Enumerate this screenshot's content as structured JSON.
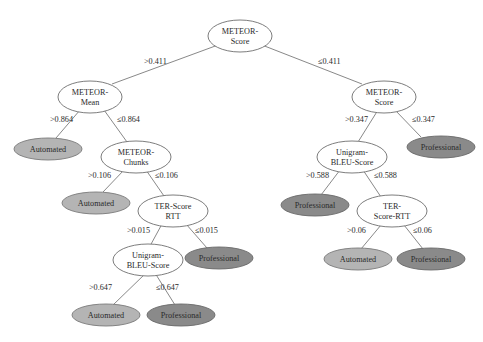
{
  "diagram": {
    "type": "decision-tree",
    "colors": {
      "internal_fill": "#ffffff",
      "automated_fill": "#b4b4b4",
      "professional_fill": "#8a8a8a",
      "edge": "#7a7a7a"
    },
    "nodes": {
      "root": {
        "line1": "METEOR-",
        "line2": "Score"
      },
      "n_meteor_mean": {
        "line1": "METEOR-",
        "line2": "Mean"
      },
      "n_meteor_score_r": {
        "line1": "METEOR-",
        "line2": "Score"
      },
      "leaf_auto_1": {
        "label": "Automated"
      },
      "n_meteor_chunks": {
        "line1": "METEOR-",
        "line2": "Chunks"
      },
      "n_unigram_bleu_r": {
        "line1": "Unigram-",
        "line2": "BLEU-Score"
      },
      "leaf_prof_r1": {
        "label": "Professional"
      },
      "leaf_auto_2": {
        "label": "Automated"
      },
      "n_ter_rtt_l": {
        "line1": "TER-Score",
        "line2": "RTT"
      },
      "leaf_prof_r2": {
        "label": "Professional"
      },
      "n_ter_rtt_r": {
        "line1": "TER-",
        "line2": "Score-RTT"
      },
      "n_unigram_bleu_l": {
        "line1": "Unigram-",
        "line2": "BLEU-Score"
      },
      "leaf_prof_l3": {
        "label": "Professional"
      },
      "leaf_auto_r3": {
        "label": "Automated"
      },
      "leaf_prof_r4": {
        "label": "Professional"
      },
      "leaf_auto_l4": {
        "label": "Automated"
      },
      "leaf_prof_l4": {
        "label": "Professional"
      }
    },
    "edges": {
      "root_left": ">0.411",
      "root_right": "≤0.411",
      "mean_left": ">0.864",
      "mean_right": "≤0.864",
      "chunks_left": ">0.106",
      "chunks_right": "≤0.106",
      "terl_left": ">0.015",
      "terl_right": "≤0.015",
      "bleul_left": ">0.647",
      "bleul_right": "≤0.647",
      "scorer_left": ">0.347",
      "scorer_right": "≤0.347",
      "bleur_left": ">0.588",
      "bleur_right": "≤0.588",
      "terr_left": ">0.06",
      "terr_right": "≤0.06"
    }
  }
}
